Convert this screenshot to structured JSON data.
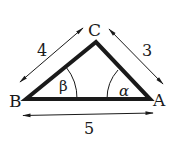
{
  "diagram": {
    "type": "triangle",
    "vertices": {
      "A": {
        "label": "A"
      },
      "B": {
        "label": "B"
      },
      "C": {
        "label": "C"
      }
    },
    "angles": {
      "at_A": {
        "label": "α"
      },
      "at_B": {
        "label": "β"
      }
    },
    "side_lengths": {
      "BC": {
        "label": "4"
      },
      "CA": {
        "label": "3"
      },
      "BA": {
        "label": "5"
      }
    },
    "colors": {
      "stroke": "#1a1a1a",
      "background": "#ffffff"
    }
  }
}
